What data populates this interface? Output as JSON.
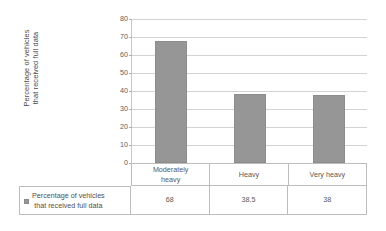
{
  "chart_data": {
    "type": "bar",
    "title": "",
    "xlabel": "",
    "ylabel": "Percentage of vehicles that received full data",
    "categories": [
      "Moderately heavy",
      "Heavy",
      "Very heavy"
    ],
    "values": [
      68,
      38.5,
      38
    ],
    "value_labels": [
      "68",
      "38.5",
      "38"
    ],
    "series": [
      {
        "name": "Percentage of vehicles that received full data",
        "values": [
          68,
          38.5,
          38
        ],
        "color": "#969696"
      }
    ],
    "ylim": [
      0,
      80
    ],
    "ytick_step": 10,
    "ytick_labels": [
      "80",
      "70",
      "60",
      "50",
      "40",
      "30",
      "20",
      "10",
      "0"
    ],
    "grid": true,
    "legend_position": "bottom-table",
    "has_data_table": true
  },
  "axis": {
    "y_title_line1": "Percentage of vehicles",
    "y_title_line2": "that received full data"
  },
  "legend": {
    "marker_name": "legend-swatch",
    "line1": "Percentage of vehicles",
    "line2": "that received full data"
  },
  "table": {
    "categories": [
      {
        "line1": "Moderately",
        "line2": "heavy"
      },
      {
        "line1": "Heavy",
        "line2": ""
      },
      {
        "line1": "Very heavy",
        "line2": ""
      }
    ],
    "values": [
      "68",
      "38.5",
      "38"
    ]
  },
  "colors": {
    "bar": "#969696",
    "gridline": "#d2d2d2",
    "axis": "#9e9e9e",
    "table_border": "#bdbdbd",
    "text": "#575757",
    "background": "#ffffff"
  }
}
